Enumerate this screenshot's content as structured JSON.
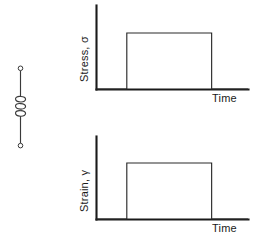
{
  "figure": {
    "title": "",
    "background_color": "#ffffff",
    "ink_color": "#1a1a1a"
  },
  "model": {
    "element_name": "spring",
    "element_label": "",
    "description": "Hookean elastic spring element",
    "coil_count": 3
  },
  "charts": [
    {
      "id": "stress",
      "ylabel": "Stress, σ",
      "xlabel": "Time",
      "axis_color": "#1a1a1a",
      "curve_color": "#2b2b2b"
    },
    {
      "id": "strain",
      "ylabel": "Strain, γ",
      "xlabel": "Time",
      "axis_color": "#1a1a1a",
      "curve_color": "#2b2b2b"
    }
  ],
  "chart_data": [
    {
      "type": "line",
      "id": "stress-vs-time",
      "title": "",
      "xlabel": "Time",
      "ylabel": "Stress, σ",
      "x": [
        0,
        0.2,
        0.2,
        0.76,
        0.76,
        1.0
      ],
      "values": [
        0,
        0,
        1,
        1,
        0,
        0
      ],
      "series": [
        {
          "name": "Stress, σ",
          "x": [
            0,
            0.2,
            0.2,
            0.76,
            0.76,
            1.0
          ],
          "values": [
            0,
            0,
            1,
            1,
            0,
            0
          ]
        }
      ],
      "xlim": [
        0,
        1.0
      ],
      "ylim": [
        0,
        1.25
      ],
      "xticks": [],
      "yticks": [],
      "grid": false,
      "legend": false,
      "annotations": [
        "Applied constant stress step pulse"
      ]
    },
    {
      "type": "line",
      "id": "strain-vs-time",
      "title": "",
      "xlabel": "Time",
      "ylabel": "Strain, γ",
      "x": [
        0,
        0.2,
        0.2,
        0.76,
        0.76,
        1.0
      ],
      "values": [
        0,
        0,
        1,
        1,
        0,
        0
      ],
      "series": [
        {
          "name": "Strain, γ",
          "x": [
            0,
            0.2,
            0.2,
            0.76,
            0.76,
            1.0
          ],
          "values": [
            0,
            0,
            1,
            1,
            0,
            0
          ]
        }
      ],
      "xlim": [
        0,
        1.0
      ],
      "ylim": [
        0,
        1.25
      ],
      "xticks": [],
      "yticks": [],
      "grid": false,
      "legend": false,
      "annotations": [
        "Instantaneous elastic strain response"
      ]
    }
  ]
}
